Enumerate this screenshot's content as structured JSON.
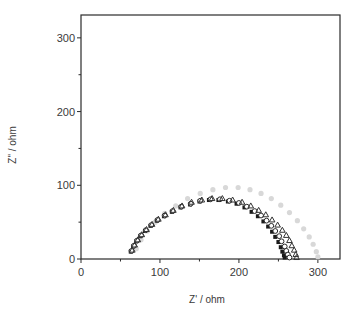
{
  "chart_data": {
    "type": "scatter",
    "title": "",
    "xlabel": "Z' / ohm",
    "ylabel": "Z\" / ohm",
    "xlim": [
      0,
      328
    ],
    "ylim": [
      0,
      331
    ],
    "x_ticks": [
      0,
      100,
      200,
      300
    ],
    "x_minor_ticks": [
      50,
      150,
      250
    ],
    "y_ticks": [
      0,
      100,
      200,
      300
    ],
    "y_minor_ticks": [
      50,
      150,
      250
    ],
    "x_tick_labels": [
      "0",
      "100",
      "200",
      "300"
    ],
    "y_tick_labels": [
      "0",
      "100",
      "200",
      "300"
    ],
    "grid": false,
    "legend": null,
    "series": [
      {
        "name": "series-1",
        "marker": "filled-square",
        "color": "#1a1a1a",
        "x": [
          63,
          66,
          70,
          75,
          81,
          88,
          96,
          105,
          115,
          126,
          138,
          150,
          162,
          174,
          186,
          197,
          207,
          216,
          224,
          231,
          237,
          242,
          246,
          250,
          253,
          255,
          257,
          258
        ],
        "y": [
          10,
          17,
          24,
          31,
          38,
          45,
          52,
          58,
          64,
          70,
          74,
          78,
          80,
          80,
          78,
          75,
          70,
          64,
          58,
          51,
          44,
          37,
          30,
          23,
          16,
          10,
          5,
          2
        ]
      },
      {
        "name": "series-2",
        "marker": "open-circle",
        "color": "#2a2a2a",
        "x": [
          64,
          67,
          71,
          76,
          82,
          89,
          97,
          106,
          116,
          127,
          139,
          151,
          164,
          176,
          188,
          200,
          210,
          220,
          228,
          235,
          241,
          246,
          251,
          254,
          258,
          260,
          262,
          264
        ],
        "y": [
          11,
          18,
          25,
          32,
          39,
          46,
          53,
          59,
          65,
          71,
          75,
          79,
          81,
          81,
          79,
          76,
          71,
          65,
          59,
          52,
          45,
          38,
          31,
          24,
          17,
          11,
          6,
          2
        ]
      },
      {
        "name": "series-3",
        "marker": "open-triangle",
        "color": "#333333",
        "x": [
          65,
          68,
          72,
          77,
          83,
          90,
          98,
          107,
          117,
          128,
          140,
          153,
          166,
          179,
          192,
          204,
          215,
          225,
          234,
          242,
          249,
          255,
          260,
          264,
          267,
          270,
          272,
          273
        ],
        "y": [
          12,
          19,
          26,
          33,
          40,
          47,
          54,
          60,
          66,
          72,
          77,
          80,
          82,
          82,
          80,
          77,
          72,
          66,
          60,
          53,
          46,
          39,
          32,
          25,
          18,
          12,
          6,
          2
        ]
      },
      {
        "name": "series-4",
        "marker": "filled-circle",
        "color": "#d8d8d8",
        "x": [
          70,
          76,
          84,
          94,
          106,
          120,
          135,
          151,
          167,
          183,
          199,
          214,
          228,
          241,
          253,
          264,
          274,
          282,
          289,
          294,
          298,
          300
        ],
        "y": [
          14,
          26,
          38,
          50,
          62,
          72,
          82,
          89,
          94,
          97,
          97,
          94,
          89,
          82,
          73,
          63,
          52,
          41,
          30,
          20,
          10,
          3
        ]
      }
    ]
  }
}
